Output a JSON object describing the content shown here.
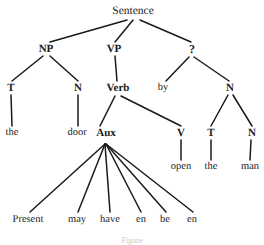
{
  "diagram": {
    "type": "syntax-tree",
    "title": "Sentence",
    "caption_fragment": "Figure",
    "ink_color": "#1a1a1a",
    "background_color": "#ffffff"
  },
  "nodes": [
    {
      "id": "sentence",
      "label": "Sentence",
      "x": 133,
      "y": 12,
      "kind": "root"
    },
    {
      "id": "np",
      "label": "NP",
      "x": 46,
      "y": 49,
      "kind": "cat"
    },
    {
      "id": "vp",
      "label": "VP",
      "x": 114,
      "y": 49,
      "kind": "cat"
    },
    {
      "id": "qmark",
      "label": "?",
      "x": 192,
      "y": 49,
      "kind": "q"
    },
    {
      "id": "t1",
      "label": "T",
      "x": 11,
      "y": 88,
      "kind": "cat"
    },
    {
      "id": "n1",
      "label": "N",
      "x": 78,
      "y": 88,
      "kind": "cat"
    },
    {
      "id": "verb",
      "label": "Verb",
      "x": 118,
      "y": 88,
      "kind": "cat"
    },
    {
      "id": "by",
      "label": "by",
      "x": 163,
      "y": 88,
      "kind": "word"
    },
    {
      "id": "n2",
      "label": "N",
      "x": 230,
      "y": 88,
      "kind": "cat"
    },
    {
      "id": "the1",
      "label": "the",
      "x": 12,
      "y": 133,
      "kind": "word"
    },
    {
      "id": "door",
      "label": "door",
      "x": 77,
      "y": 133,
      "kind": "word"
    },
    {
      "id": "aux",
      "label": "Aux",
      "x": 106,
      "y": 133,
      "kind": "cat"
    },
    {
      "id": "v",
      "label": "V",
      "x": 181,
      "y": 133,
      "kind": "cat"
    },
    {
      "id": "t2",
      "label": "T",
      "x": 211,
      "y": 133,
      "kind": "cat"
    },
    {
      "id": "n3",
      "label": "N",
      "x": 252,
      "y": 133,
      "kind": "cat"
    },
    {
      "id": "open",
      "label": "open",
      "x": 181,
      "y": 167,
      "kind": "word"
    },
    {
      "id": "the2",
      "label": "the",
      "x": 211,
      "y": 167,
      "kind": "word"
    },
    {
      "id": "man",
      "label": "man",
      "x": 250,
      "y": 167,
      "kind": "word"
    },
    {
      "id": "present",
      "label": "Present",
      "x": 28,
      "y": 220,
      "kind": "word"
    },
    {
      "id": "may",
      "label": "may",
      "x": 77,
      "y": 220,
      "kind": "word"
    },
    {
      "id": "have",
      "label": "have",
      "x": 110,
      "y": 220,
      "kind": "word"
    },
    {
      "id": "en1",
      "label": "en",
      "x": 141,
      "y": 220,
      "kind": "word"
    },
    {
      "id": "be",
      "label": "be",
      "x": 165,
      "y": 220,
      "kind": "word"
    },
    {
      "id": "en2",
      "label": "en",
      "x": 192,
      "y": 220,
      "kind": "word"
    }
  ],
  "edges": [
    {
      "from": "sentence",
      "to": "np",
      "x1": 127,
      "y1": 20,
      "x2": 50,
      "y2": 42
    },
    {
      "from": "sentence",
      "to": "vp",
      "x1": 133,
      "y1": 20,
      "x2": 115,
      "y2": 42
    },
    {
      "from": "sentence",
      "to": "qmark",
      "x1": 140,
      "y1": 20,
      "x2": 191,
      "y2": 42
    },
    {
      "from": "np",
      "to": "t1",
      "x1": 43,
      "y1": 56,
      "x2": 12,
      "y2": 81
    },
    {
      "from": "np",
      "to": "n1",
      "x1": 50,
      "y1": 56,
      "x2": 78,
      "y2": 81
    },
    {
      "from": "vp",
      "to": "verb",
      "x1": 115,
      "y1": 56,
      "x2": 117,
      "y2": 81
    },
    {
      "from": "qmark",
      "to": "by",
      "x1": 189,
      "y1": 57,
      "x2": 166,
      "y2": 81
    },
    {
      "from": "qmark",
      "to": "n2",
      "x1": 194,
      "y1": 57,
      "x2": 229,
      "y2": 81
    },
    {
      "from": "t1",
      "to": "the1",
      "x1": 11,
      "y1": 95,
      "x2": 12,
      "y2": 126
    },
    {
      "from": "n1",
      "to": "door",
      "x1": 78,
      "y1": 95,
      "x2": 78,
      "y2": 126
    },
    {
      "from": "verb",
      "to": "aux",
      "x1": 115,
      "y1": 96,
      "x2": 100,
      "y2": 126
    },
    {
      "from": "verb",
      "to": "v",
      "x1": 121,
      "y1": 96,
      "x2": 181,
      "y2": 126
    },
    {
      "from": "n2",
      "to": "t2",
      "x1": 228,
      "y1": 95,
      "x2": 211,
      "y2": 126
    },
    {
      "from": "n2",
      "to": "n3",
      "x1": 233,
      "y1": 95,
      "x2": 252,
      "y2": 126
    },
    {
      "from": "v",
      "to": "open",
      "x1": 181,
      "y1": 140,
      "x2": 181,
      "y2": 160
    },
    {
      "from": "t2",
      "to": "the2",
      "x1": 211,
      "y1": 140,
      "x2": 211,
      "y2": 160
    },
    {
      "from": "n3",
      "to": "man",
      "x1": 251,
      "y1": 140,
      "x2": 250,
      "y2": 160
    },
    {
      "from": "aux",
      "to": "present",
      "x1": 105,
      "y1": 144,
      "x2": 30,
      "y2": 212
    },
    {
      "from": "aux",
      "to": "may",
      "x1": 105,
      "y1": 144,
      "x2": 78,
      "y2": 212
    },
    {
      "from": "aux",
      "to": "have",
      "x1": 105,
      "y1": 144,
      "x2": 110,
      "y2": 212
    },
    {
      "from": "aux",
      "to": "en1",
      "x1": 106,
      "y1": 144,
      "x2": 141,
      "y2": 212
    },
    {
      "from": "aux",
      "to": "be",
      "x1": 106,
      "y1": 144,
      "x2": 166,
      "y2": 212
    },
    {
      "from": "aux",
      "to": "en2",
      "x1": 106,
      "y1": 144,
      "x2": 193,
      "y2": 212
    }
  ]
}
